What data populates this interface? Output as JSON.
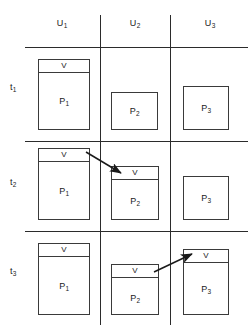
{
  "figure": {
    "background_color": "#ffffff",
    "line_color": "#2b2b2b",
    "box_border_color": "#3a3a3a",
    "text_color": "#1a1a1a"
  },
  "columns": [
    {
      "id": "u1",
      "label": "U",
      "subscript": "1",
      "center_x": 62
    },
    {
      "id": "u2",
      "label": "U",
      "subscript": "2",
      "center_x": 135
    },
    {
      "id": "u3",
      "label": "U",
      "subscript": "3",
      "center_x": 210
    }
  ],
  "rows": [
    {
      "id": "t1",
      "label": "t",
      "subscript": "1",
      "center_y": 88
    },
    {
      "id": "t2",
      "label": "t",
      "subscript": "2",
      "center_y": 183
    },
    {
      "id": "t3",
      "label": "t",
      "subscript": "3",
      "center_y": 272
    }
  ],
  "cells": {
    "t1": {
      "p1": {
        "label": "P",
        "subscript": "1",
        "token": "V",
        "has_token": true
      },
      "p2": {
        "label": "P",
        "subscript": "2",
        "token": "V",
        "has_token": false
      },
      "p3": {
        "label": "P",
        "subscript": "3",
        "token": "V",
        "has_token": false
      }
    },
    "t2": {
      "p1": {
        "label": "P",
        "subscript": "1",
        "token": "V",
        "has_token": true
      },
      "p2": {
        "label": "P",
        "subscript": "2",
        "token": "V",
        "has_token": true
      },
      "p3": {
        "label": "P",
        "subscript": "3",
        "token": "V",
        "has_token": false
      }
    },
    "t3": {
      "p1": {
        "label": "P",
        "subscript": "1",
        "token": "V",
        "has_token": true
      },
      "p2": {
        "label": "P",
        "subscript": "2",
        "token": "V",
        "has_token": true
      },
      "p3": {
        "label": "P",
        "subscript": "3",
        "token": "V",
        "has_token": true
      }
    }
  },
  "arrows": [
    {
      "id": "arrow-t2-p1-to-p2",
      "from": "t2.p1.token",
      "to": "t2.p2.token"
    },
    {
      "id": "arrow-t3-p2-to-p3",
      "from": "t3.p2.token",
      "to": "t3.p3.token"
    }
  ]
}
